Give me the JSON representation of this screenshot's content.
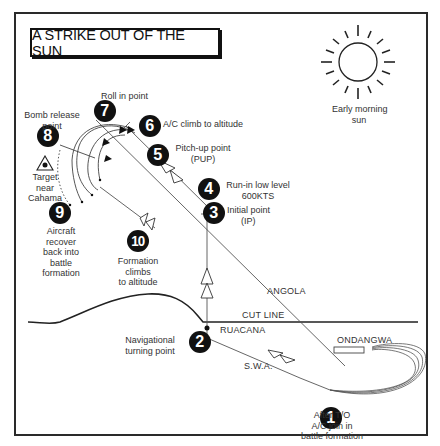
{
  "title": "A STRIKE OUT OF THE SUN",
  "sun": {
    "label_line1": "Early morning",
    "label_line2": "sun",
    "icon": "sun-icon"
  },
  "target": {
    "icon": "target-triangle-icon",
    "lines": [
      "Target",
      "near",
      "Cahama"
    ]
  },
  "steps": [
    {
      "n": "1",
      "lines": [
        "After T/O",
        "A/C join in",
        "battle formation"
      ]
    },
    {
      "n": "2",
      "lines": [
        "Navigational",
        "turning point"
      ]
    },
    {
      "n": "3",
      "lines": [
        "Initial point",
        "(IP)"
      ]
    },
    {
      "n": "4",
      "lines": [
        "Run-in low level",
        "600KTS"
      ]
    },
    {
      "n": "5",
      "lines": [
        "Pitch-up point",
        "(PUP)"
      ]
    },
    {
      "n": "6",
      "lines": [
        "A/C climb to altitude"
      ]
    },
    {
      "n": "7",
      "lines": [
        "Roll in point"
      ]
    },
    {
      "n": "8",
      "lines": [
        "Bomb release",
        "point"
      ]
    },
    {
      "n": "9",
      "lines": [
        "Aircraft",
        "recover",
        "back into",
        "battle",
        "formation"
      ]
    },
    {
      "n": "10",
      "lines": [
        "Formation",
        "climbs",
        "to altitude"
      ]
    }
  ],
  "places": {
    "angola": "ANGOLA",
    "cut_line": "CUT LINE",
    "ruacana": "RUACANA",
    "ondangwa": "ONDANGWA",
    "swa": "S.W.A."
  },
  "colors": {
    "ink": "#111111",
    "line": "#444444",
    "text": "#333333",
    "background": "#ffffff"
  }
}
